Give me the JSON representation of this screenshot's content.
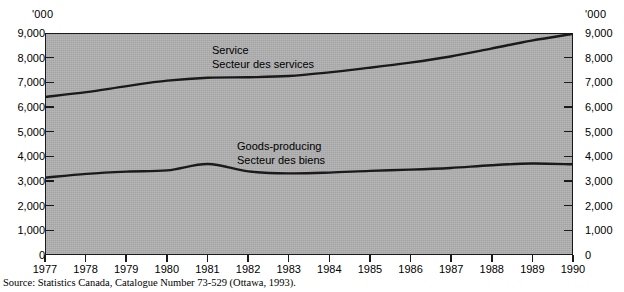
{
  "axes": {
    "unit_label_left": "'000",
    "unit_label_right": "'000",
    "y_ticks": [
      "9,000",
      "8,000",
      "7,000",
      "6,000",
      "5,000",
      "4,000",
      "3,000",
      "2,000",
      "1,000",
      "0"
    ],
    "x_ticks": [
      "1977",
      "1978",
      "1979",
      "1980",
      "1981",
      "1982",
      "1983",
      "1984",
      "1985",
      "1986",
      "1987",
      "1988",
      "1989",
      "1990"
    ]
  },
  "annotations": {
    "service_en": "Service",
    "service_fr": "Secteur des services",
    "goods_en": "Goods-producing",
    "goods_fr": "Secteur des biens"
  },
  "source": {
    "text": "Source: Statistics Canada, Catalogue Number 73-529 (Ottawa, 1993)."
  },
  "colors": {
    "plot_background": "#b0b0b0",
    "frame": "#1a1a1a",
    "series_line": "#1a1a1a",
    "page_background": "#ffffff",
    "text": "#000000"
  },
  "chart_data": {
    "type": "line",
    "title": "",
    "subtitle": "",
    "xlabel": "",
    "ylabel": "'000",
    "ylim": [
      0,
      9000
    ],
    "xlim": [
      1977,
      1990
    ],
    "y_unit": "thousands of persons",
    "grid": false,
    "legend_position": "inline-annotations",
    "x": [
      1977,
      1978,
      1979,
      1980,
      1981,
      1982,
      1983,
      1984,
      1985,
      1986,
      1987,
      1988,
      1989,
      1990
    ],
    "series": [
      {
        "name": "Service / Secteur des services",
        "values": [
          6430,
          6620,
          6870,
          7090,
          7210,
          7230,
          7280,
          7430,
          7620,
          7830,
          8080,
          8400,
          8730,
          9000
        ]
      },
      {
        "name": "Goods-producing / Secteur des biens",
        "values": [
          3130,
          3280,
          3370,
          3420,
          3680,
          3380,
          3300,
          3330,
          3400,
          3450,
          3520,
          3630,
          3700,
          3670
        ]
      }
    ],
    "annotations": [
      {
        "text": "Service",
        "series": "Service / Secteur des services"
      },
      {
        "text": "Secteur des services",
        "series": "Service / Secteur des services"
      },
      {
        "text": "Goods-producing",
        "series": "Goods-producing / Secteur des biens"
      },
      {
        "text": "Secteur des biens",
        "series": "Goods-producing / Secteur des biens"
      }
    ]
  }
}
